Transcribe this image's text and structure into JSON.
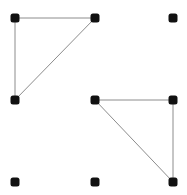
{
  "board": {
    "grid": {
      "cols": 3,
      "rows": 3
    },
    "colors": {
      "dot": "#111111",
      "line": "#8c8c8c",
      "background": "#ffffff"
    },
    "dots": [
      {
        "id": "r0c0",
        "row": 0,
        "col": 0,
        "x": 15,
        "y": 18
      },
      {
        "id": "r0c1",
        "row": 0,
        "col": 1,
        "x": 95,
        "y": 18
      },
      {
        "id": "r0c2",
        "row": 0,
        "col": 2,
        "x": 173,
        "y": 18
      },
      {
        "id": "r1c0",
        "row": 1,
        "col": 0,
        "x": 15,
        "y": 100
      },
      {
        "id": "r1c1",
        "row": 1,
        "col": 1,
        "x": 95,
        "y": 100
      },
      {
        "id": "r1c2",
        "row": 1,
        "col": 2,
        "x": 173,
        "y": 100
      },
      {
        "id": "r2c0",
        "row": 2,
        "col": 0,
        "x": 15,
        "y": 182
      },
      {
        "id": "r2c1",
        "row": 2,
        "col": 1,
        "x": 95,
        "y": 182
      },
      {
        "id": "r2c2",
        "row": 2,
        "col": 2,
        "x": 173,
        "y": 182
      }
    ],
    "edges": [
      {
        "from": "r0c0",
        "to": "r0c1"
      },
      {
        "from": "r0c0",
        "to": "r1c0"
      },
      {
        "from": "r0c1",
        "to": "r1c0"
      },
      {
        "from": "r1c1",
        "to": "r1c2"
      },
      {
        "from": "r1c2",
        "to": "r2c2"
      },
      {
        "from": "r1c1",
        "to": "r2c2"
      }
    ]
  }
}
